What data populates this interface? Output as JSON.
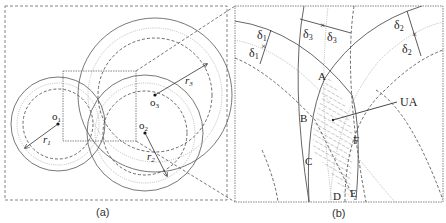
{
  "figure": {
    "panel_a": {
      "caption": "(a)",
      "centers": [
        {
          "label": "o",
          "sub": "1"
        },
        {
          "label": "o",
          "sub": "2"
        },
        {
          "label": "o",
          "sub": "3"
        }
      ],
      "radii": [
        {
          "label": "r",
          "sub": "1"
        },
        {
          "label": "r",
          "sub": "2"
        },
        {
          "label": "r",
          "sub": "3"
        }
      ]
    },
    "panel_b": {
      "caption": "(b)",
      "deltas": [
        {
          "label": "δ",
          "sub": "1"
        },
        {
          "label": "δ",
          "sub": "1"
        },
        {
          "label": "δ",
          "sub": "3"
        },
        {
          "label": "δ",
          "sub": "3"
        },
        {
          "label": "δ",
          "sub": "2"
        },
        {
          "label": "δ",
          "sub": "2"
        }
      ],
      "points": [
        "A",
        "B",
        "C",
        "D",
        "E",
        "F"
      ],
      "region_label": "UA"
    },
    "colors": {
      "solid": "#555555",
      "dashed": "#444444",
      "dotted": "#b8b8b8",
      "frame": "#666666"
    }
  }
}
